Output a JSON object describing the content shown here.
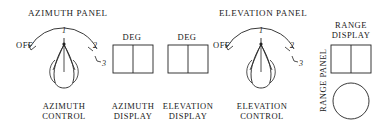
{
  "diagram": {
    "panels": [
      {
        "id": "azimuth-panel",
        "title": "AZIMUTH PANEL",
        "control": {
          "label_line1": "AZIMUTH",
          "label_line2": "CONTROL",
          "off_label": "OFF",
          "positions": [
            "1",
            "2",
            "3"
          ]
        }
      },
      {
        "id": "elevation-panel",
        "title": "ELEVATION PANEL",
        "control": {
          "label_line1": "ELEVATION",
          "label_line2": "CONTROL",
          "off_label": "OFF",
          "positions": [
            "1",
            "2",
            "3"
          ]
        }
      },
      {
        "id": "range-panel",
        "title": "RANGE PANEL",
        "display_line1": "RANGE",
        "display_line2": "DISPLAY"
      }
    ],
    "displays": [
      {
        "id": "azimuth-display",
        "unit": "DEG",
        "caption_line1": "AZIMUTH",
        "caption_line2": "DISPLAY"
      },
      {
        "id": "elevation-display",
        "unit": "DEG",
        "caption_line1": "ELEVATION",
        "caption_line2": "DISPLAY"
      }
    ],
    "colors": {
      "ink": "#222222",
      "background": "#ffffff"
    }
  }
}
